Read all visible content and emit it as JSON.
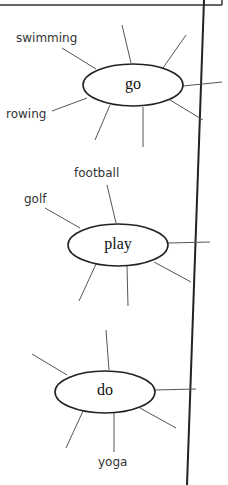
{
  "diagram": {
    "type": "spider-diagrams",
    "nodes": [
      {
        "id": "go",
        "label": "go",
        "spokes_labels": [
          "swimming",
          "rowing"
        ]
      },
      {
        "id": "play",
        "label": "play",
        "spokes_labels": [
          "football",
          "golf"
        ]
      },
      {
        "id": "do",
        "label": "do",
        "spokes_labels": [
          "yoga"
        ]
      }
    ]
  },
  "labels": {
    "swimming": "swimming",
    "rowing": "rowing",
    "football": "football",
    "golf": "golf",
    "yoga": "yoga"
  }
}
